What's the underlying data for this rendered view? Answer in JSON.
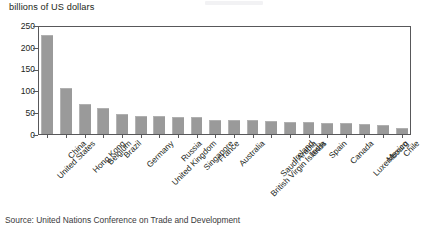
{
  "figure": {
    "axis_title": "billions of US dollars",
    "source_note": "Source: United Nations Conference on Trade and Development"
  },
  "chart_data": {
    "type": "bar",
    "title": "",
    "subtitle": "",
    "xlabel": "",
    "ylabel": "billions of US dollars",
    "ylim": [
      0,
      250
    ],
    "yticks": [
      0,
      50,
      100,
      150,
      200,
      250
    ],
    "grid": false,
    "legend": "none",
    "bar_color": "#9a9a9a",
    "categories": [
      "United States",
      "China",
      "Hong Kong",
      "Belgium",
      "Brazil",
      "Germany",
      "United Kingdom",
      "Russia",
      "Singapore",
      "France",
      "Australia",
      "British Virgin Islands",
      "Saudi Arabia",
      "Ireland",
      "India",
      "Spain",
      "Canada",
      "Luxembourg",
      "Mexico",
      "Chile"
    ],
    "values": [
      228,
      104,
      67,
      57,
      43,
      40,
      39,
      38,
      37,
      31,
      30,
      29,
      28,
      26,
      25,
      24,
      23,
      20,
      19,
      11
    ]
  }
}
